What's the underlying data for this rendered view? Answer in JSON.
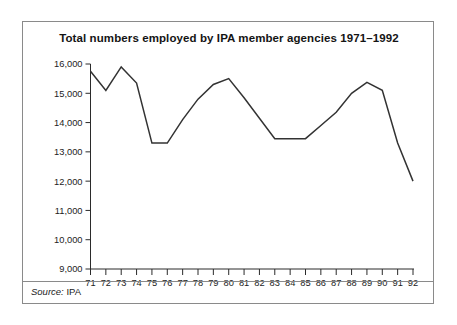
{
  "figure": {
    "title": "Total numbers employed by IPA member agencies 1971–1992",
    "source_label": "Source:",
    "source_value": "IPA",
    "border_color": "#8a8a8a",
    "line_color": "#333333",
    "background": "#ffffff"
  },
  "chart_data": {
    "type": "line",
    "title": "Total numbers employed by IPA member agencies 1971–1992",
    "xlabel": "",
    "ylabel": "",
    "grid": false,
    "legend": null,
    "ylim": [
      9000,
      16000
    ],
    "ytick_labels": [
      "16,000",
      "15,000",
      "14,000",
      "13,000",
      "12,000",
      "11,000",
      "10,000",
      "9,000"
    ],
    "ytick_values": [
      16000,
      15000,
      14000,
      13000,
      12000,
      11000,
      10000,
      9000
    ],
    "categories": [
      "71",
      "72",
      "73",
      "74",
      "75",
      "76",
      "77",
      "78",
      "79",
      "80",
      "81",
      "82",
      "83",
      "84",
      "85",
      "86",
      "87",
      "88",
      "89",
      "90",
      "91",
      "92"
    ],
    "x": [
      1971,
      1972,
      1973,
      1974,
      1975,
      1976,
      1977,
      1978,
      1979,
      1980,
      1981,
      1982,
      1983,
      1984,
      1985,
      1986,
      1987,
      1988,
      1989,
      1990,
      1991,
      1992
    ],
    "values": [
      15750,
      15100,
      15900,
      15350,
      13300,
      13300,
      14100,
      14800,
      15300,
      15500,
      14850,
      14150,
      13450,
      13450,
      13450,
      13900,
      14350,
      15000,
      15370,
      15100,
      13300,
      12000
    ],
    "series": [
      {
        "name": "Total numbers employed",
        "values": [
          15750,
          15100,
          15900,
          15350,
          13300,
          13300,
          14100,
          14800,
          15300,
          15500,
          14850,
          14150,
          13450,
          13450,
          13450,
          13900,
          14350,
          15000,
          15370,
          15100,
          13300,
          12000
        ]
      }
    ]
  }
}
